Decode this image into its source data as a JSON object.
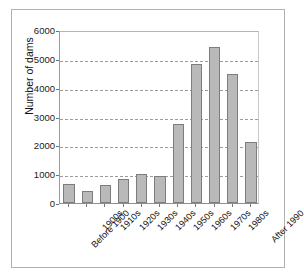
{
  "chart_data": {
    "type": "bar",
    "title": "",
    "xlabel": "",
    "ylabel": "Number of dams",
    "categories": [
      "Before 1900",
      "1900s",
      "1910s",
      "1920s",
      "1930s",
      "1940s",
      "1950s",
      "1960s",
      "1970s",
      "1980s",
      "After 1990"
    ],
    "values": [
      660,
      400,
      640,
      850,
      1010,
      930,
      2750,
      4820,
      5420,
      4480,
      2110
    ],
    "ylim": [
      0,
      6000
    ],
    "yticks": [
      0,
      1000,
      2000,
      3000,
      4000,
      5000,
      6000
    ],
    "ytick_labels": [
      "0",
      "1000",
      "2000",
      "3000",
      "4000",
      "5000",
      "6000"
    ],
    "grid": "horizontal-dashed",
    "legend": null,
    "bar_fill_color": "#b9b9b9",
    "bar_edge_color": "#7d7d7d",
    "axis_color": "#8f8f8f",
    "gridline_color": "#9c9c9c",
    "background_color": "#ffffff",
    "frame_color": "#b0b0b0"
  }
}
